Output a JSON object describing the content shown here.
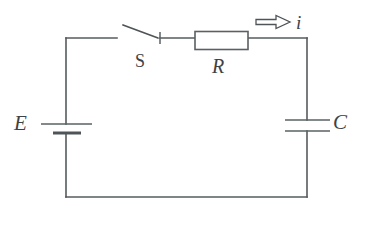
{
  "diagram": {
    "type": "electrical-schematic",
    "background_color": "#ffffff",
    "line_color": "#555b5e",
    "label_color": "#3d4245"
  },
  "labels": {
    "source": "E",
    "switch": "S",
    "resistor": "R",
    "capacitor": "C",
    "current": "i"
  },
  "components": [
    {
      "name": "battery",
      "symbol": "E",
      "position": "left-branch",
      "description": "DC voltage source, long plate above short plate"
    },
    {
      "name": "switch",
      "symbol": "S",
      "position": "top-branch-left",
      "state": "open",
      "description": "single pole switch shown open"
    },
    {
      "name": "resistor",
      "symbol": "R",
      "position": "top-branch-right",
      "description": "rectangular resistor box"
    },
    {
      "name": "capacitor",
      "symbol": "C",
      "position": "right-branch",
      "description": "two equal parallel plates"
    }
  ],
  "annotations": [
    {
      "name": "current-arrow",
      "symbol": "i",
      "direction": "right",
      "style": "hollow-outline-arrow",
      "position": "above-top-right-wire"
    }
  ],
  "icons": {
    "current_arrow": "arrow-right-hollow-icon",
    "battery": "battery-cell-icon",
    "resistor": "resistor-box-icon",
    "capacitor": "capacitor-plates-icon",
    "switch": "switch-open-icon"
  }
}
